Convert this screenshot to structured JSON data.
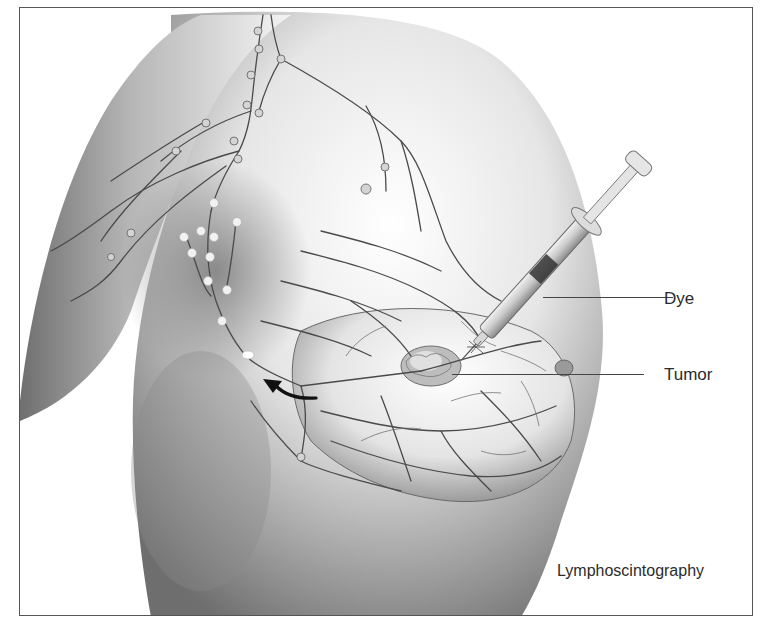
{
  "figure": {
    "caption": "Lymphoscintography",
    "labels": {
      "dye": "Dye",
      "tumor": "Tumor"
    },
    "colors": {
      "frame": "#555555",
      "ink": "#2b2b2b",
      "skin_shadow": "#7a7a7a",
      "vessel": "#4a4a4a",
      "node": "#cfcfcf"
    }
  }
}
